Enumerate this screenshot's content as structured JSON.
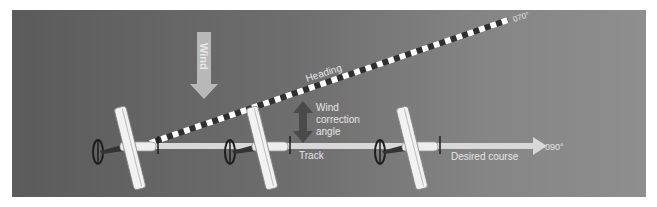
{
  "diagram": {
    "title": "Wind correction angle",
    "colors": {
      "background_left": "#5b5b5b",
      "background_right": "#8e8e8e",
      "track_line": "#dcdcdc",
      "heading_stripe_light": "#ffffff",
      "heading_stripe_dark": "#3a3a3a",
      "wind_arrow": "#b5b5b5",
      "wca_arrow": "#4a4a4a",
      "label": "#e6e6e6"
    },
    "labels": {
      "wind": "Wind",
      "heading": "Heading",
      "heading_value": "070°",
      "wca_line1": "Wind",
      "wca_line2": "correction",
      "wca_line3": "angle",
      "track": "Track",
      "desired_course": "Desired course",
      "course_value": "090°"
    },
    "aircraft": [
      {
        "name": "aircraft-1",
        "x": 130,
        "y": 148
      },
      {
        "name": "aircraft-2",
        "x": 260,
        "y": 148
      },
      {
        "name": "aircraft-3",
        "x": 412,
        "y": 148
      }
    ]
  }
}
